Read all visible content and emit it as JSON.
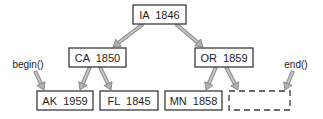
{
  "diagram": {
    "type": "binary-search-tree-iterator",
    "nodes": [
      {
        "id": "ia",
        "key": "IA",
        "value": "1846",
        "label": "IA  1846",
        "x": 133,
        "y": 5,
        "w": 53,
        "h": 19,
        "dashed": false
      },
      {
        "id": "ca",
        "key": "CA",
        "value": "1850",
        "label": "CA  1850",
        "x": 69,
        "y": 48,
        "w": 57,
        "h": 19,
        "dashed": false
      },
      {
        "id": "or",
        "key": "OR",
        "value": "1859",
        "label": "OR  1859",
        "x": 195,
        "y": 48,
        "w": 58,
        "h": 19,
        "dashed": false
      },
      {
        "id": "ak",
        "key": "AK",
        "value": "1959",
        "label": "AK  1959",
        "x": 37,
        "y": 91,
        "w": 56,
        "h": 19,
        "dashed": false
      },
      {
        "id": "fl",
        "key": "FL",
        "value": "1845",
        "label": "FL  1845",
        "x": 100,
        "y": 91,
        "w": 58,
        "h": 19,
        "dashed": false
      },
      {
        "id": "mn",
        "key": "MN",
        "value": "1858",
        "label": "MN  1858",
        "x": 165,
        "y": 91,
        "w": 57,
        "h": 19,
        "dashed": false
      },
      {
        "id": "end-sentinel",
        "key": "",
        "value": "",
        "label": "",
        "x": 229,
        "y": 91,
        "w": 61,
        "h": 19,
        "dashed": true
      }
    ],
    "edges": [
      {
        "from": "ia",
        "to": "ca",
        "x1": 143,
        "y1": 24,
        "x2": 113,
        "y2": 47
      },
      {
        "from": "ia",
        "to": "or",
        "x1": 176,
        "y1": 24,
        "x2": 203,
        "y2": 47
      },
      {
        "from": "ca",
        "to": "ak",
        "x1": 90,
        "y1": 67,
        "x2": 80,
        "y2": 90
      },
      {
        "from": "ca",
        "to": "fl",
        "x1": 100,
        "y1": 67,
        "x2": 111,
        "y2": 90
      },
      {
        "from": "or",
        "to": "mn",
        "x1": 216,
        "y1": 67,
        "x2": 206,
        "y2": 90
      },
      {
        "from": "or",
        "to": "end-sentinel",
        "x1": 226,
        "y1": 67,
        "x2": 238,
        "y2": 90
      }
    ],
    "pointers": [
      {
        "id": "begin",
        "label": "begin()",
        "label_x": 28,
        "label_y": 64,
        "x1": 35,
        "y1": 71,
        "x2": 44,
        "y2": 90
      },
      {
        "id": "end",
        "label": "end()",
        "label_x": 296,
        "label_y": 64,
        "x1": 293,
        "y1": 71,
        "x2": 285,
        "y2": 90
      }
    ],
    "colors": {
      "box_stroke": "#3a3a3a",
      "text": "#1e1e1e",
      "arrow_outline": "#8a8a8a",
      "arrow_fill": "#c4c4c4",
      "background": "#ffffff"
    }
  }
}
